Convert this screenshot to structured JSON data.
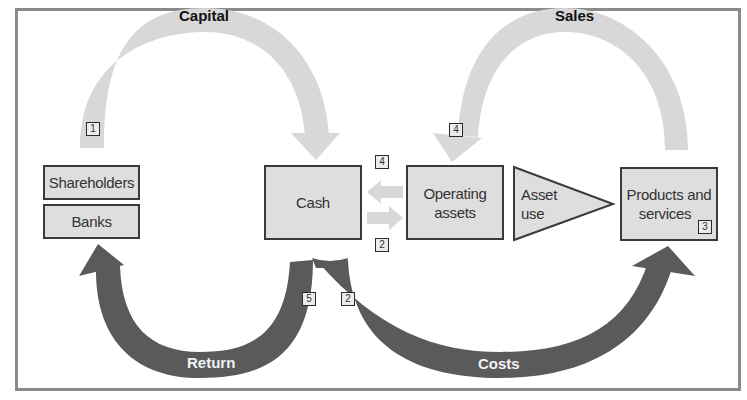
{
  "diagram": {
    "type": "capital-flow-cycle",
    "nodes": {
      "shareholders": "Shareholders",
      "banks": "Banks",
      "cash": "Cash",
      "operating_assets_line1": "Operating",
      "operating_assets_line2": "assets",
      "asset_use_line1": "Asset",
      "asset_use_line2": "use",
      "products_line1": "Products and",
      "products_line2": "services"
    },
    "flows": {
      "capital": "Capital",
      "sales": "Sales",
      "return": "Return",
      "costs": "Costs"
    },
    "badges": {
      "capital_start": "1",
      "sales_end": "4",
      "cash_in": "4",
      "cash_out": "2",
      "products": "3",
      "return": "5",
      "costs": "2"
    },
    "colors": {
      "box_fill": "#dedede",
      "box_border": "#3a3a3a",
      "light_arrow": "#d8d8d8",
      "dark_arrow": "#5a5a5a",
      "frame": "#8a8a8a"
    },
    "edges": [
      {
        "from": "Shareholders/Banks",
        "to": "Cash",
        "label": "Capital",
        "step": "1",
        "style": "light"
      },
      {
        "from": "Cash",
        "to": "Operating assets",
        "step": "2",
        "style": "light"
      },
      {
        "from": "Operating assets",
        "to": "Cash",
        "step": "4",
        "style": "light"
      },
      {
        "from": "Operating assets",
        "to": "Products and services",
        "label": "Asset use",
        "style": "triangle"
      },
      {
        "from": "Products and services",
        "to": "Operating assets",
        "label": "Sales",
        "step": "4",
        "style": "light"
      },
      {
        "from": "Cash",
        "to": "Products and services",
        "label": "Costs",
        "step": "2",
        "style": "dark"
      },
      {
        "from": "Cash",
        "to": "Shareholders/Banks",
        "label": "Return",
        "step": "5",
        "style": "dark"
      }
    ]
  }
}
